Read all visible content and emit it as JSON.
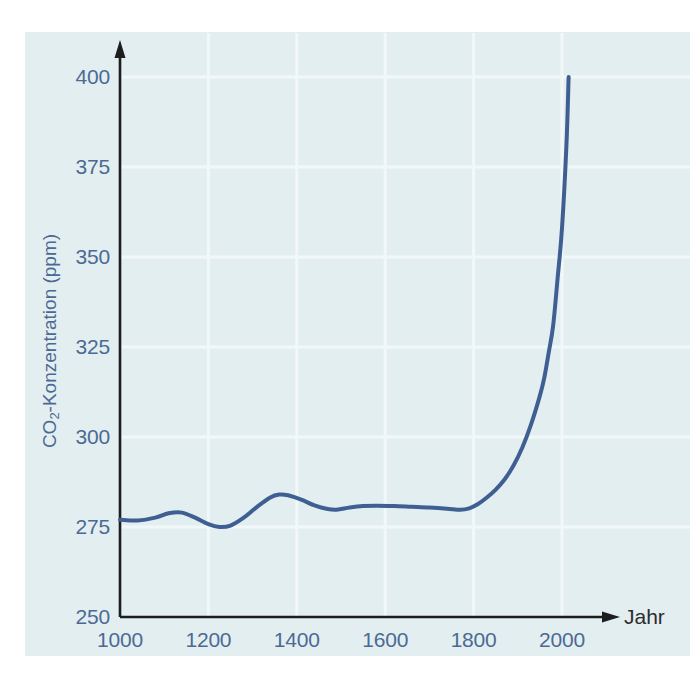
{
  "figure": {
    "background_color": "#ffffff",
    "panel_color": "#e3eef1",
    "axis_color": "#1d1d1d",
    "grid_color": "#f2f8fa",
    "tick_label_color": "#4b6a93",
    "axis_title_color": "#4b6a93"
  },
  "chart_data": {
    "type": "line",
    "title": "",
    "subtitle": "",
    "xlabel": "Jahr",
    "ylabel": "CO2-Konzentration (ppm)",
    "ylabel_parts": {
      "prefix": "CO",
      "sub": "2",
      "suffix": "-Konzentration (ppm)"
    },
    "xlim": [
      1000,
      2060
    ],
    "ylim": [
      250,
      400
    ],
    "xticks": [
      1000,
      1200,
      1400,
      1600,
      1800,
      2000
    ],
    "xtick_labels": [
      "1000",
      "1200",
      "1400",
      "1600",
      "1800",
      "2000"
    ],
    "yticks": [
      250,
      275,
      300,
      325,
      350,
      375,
      400
    ],
    "ytick_labels": [
      "250",
      "275",
      "300",
      "325",
      "350",
      "375",
      "400"
    ],
    "grid": true,
    "grid_axes": "both",
    "legend": false,
    "legend_position": "none",
    "axis_arrows": true,
    "series": [
      {
        "name": "CO2-Konzentration",
        "color": "#3f5f93",
        "line_width": 4,
        "x": [
          1000,
          1040,
          1080,
          1110,
          1140,
          1170,
          1200,
          1225,
          1250,
          1280,
          1310,
          1340,
          1360,
          1380,
          1410,
          1440,
          1470,
          1490,
          1520,
          1550,
          1580,
          1620,
          1660,
          1700,
          1740,
          1770,
          1790,
          1810,
          1830,
          1850,
          1870,
          1890,
          1910,
          1930,
          1950,
          1960,
          1970,
          1980,
          1990,
          2000,
          2010,
          2015
        ],
        "y": [
          277.0,
          276.8,
          277.6,
          278.8,
          279.0,
          277.6,
          275.8,
          275.0,
          275.4,
          277.6,
          280.6,
          283.2,
          284.0,
          283.8,
          282.6,
          281.0,
          280.0,
          279.8,
          280.4,
          280.8,
          280.9,
          280.8,
          280.6,
          280.4,
          280.1,
          279.8,
          280.2,
          281.4,
          283.2,
          285.4,
          288.2,
          292.0,
          297.0,
          303.5,
          311.5,
          316.5,
          323.5,
          331.0,
          344.0,
          358.0,
          381.0,
          400.0
        ]
      }
    ],
    "annotations": []
  },
  "axis_geometry": {
    "x_pixel_min": 120,
    "x_pixel_max": 562,
    "y_pixel_min": 617,
    "y_pixel_max": 77,
    "x_value_min": 1000,
    "x_value_max": 2000,
    "y_value_min": 250,
    "y_value_max": 400
  }
}
